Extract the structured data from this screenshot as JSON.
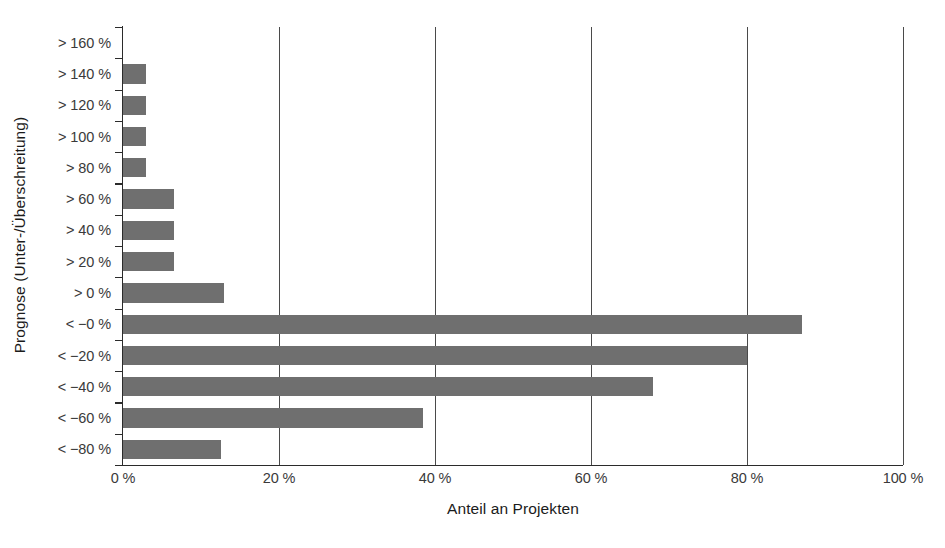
{
  "chart_data": {
    "type": "bar",
    "orientation": "horizontal",
    "title": "",
    "xlabel": "Anteil an Projekten",
    "ylabel": "Prognose (Unter-/Überschreitung)",
    "categories": [
      "> 160 %",
      "> 140 %",
      "> 120 %",
      "> 100 %",
      "> 80 %",
      "> 60 %",
      "> 40 %",
      "> 20 %",
      "> 0 %",
      "< −0 %",
      "< −20 %",
      "< −40 %",
      "< −60 %",
      "< −80 %"
    ],
    "values": [
      0,
      3,
      3,
      3,
      3,
      6.5,
      6.5,
      6.5,
      13,
      87,
      80,
      68,
      38.5,
      12.5
    ],
    "xlim": [
      0,
      100
    ],
    "xticks": [
      0,
      20,
      40,
      60,
      80,
      100
    ],
    "xtick_labels": [
      "0 %",
      "20 %",
      "40 %",
      "60 %",
      "80 %",
      "100 %"
    ],
    "grid": "vertical",
    "legend": "none",
    "bar_color": "#6f6f6f",
    "axis_color": "#2b2b2b",
    "background_color": "#ffffff"
  }
}
